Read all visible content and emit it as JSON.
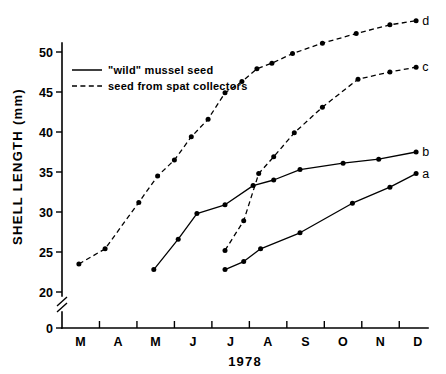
{
  "chart_data": {
    "type": "line",
    "title": "",
    "xlabel": "1978",
    "ylabel": "SHELL LENGTH (mm)",
    "x_tick_labels": [
      "M",
      "A",
      "M",
      "J",
      "J",
      "A",
      "S",
      "O",
      "N",
      "D"
    ],
    "x_tick_label_months": [
      "March",
      "April",
      "May",
      "June",
      "July",
      "August",
      "September",
      "October",
      "November",
      "December"
    ],
    "y_tick_labels": [
      "0",
      "20",
      "25",
      "30",
      "35",
      "40",
      "45",
      "50"
    ],
    "y_tick_values": [
      0,
      20,
      25,
      30,
      35,
      40,
      45,
      50
    ],
    "ylim": [
      20,
      55
    ],
    "xlim": [
      3,
      12.8
    ],
    "grid": false,
    "axis_break": true,
    "axis_break_note": "y-axis broken between 0 and 20",
    "legend_position": "upper-left-inside",
    "legend": [
      {
        "key": "solid",
        "label": "\"wild\" mussel seed",
        "style": "solid"
      },
      {
        "key": "dashed",
        "label": "seed from spat collectors",
        "style": "dashed"
      }
    ],
    "series": [
      {
        "name": "d",
        "label": "d",
        "style": "dashed",
        "description": "seed from spat collectors, earliest cohort",
        "x": [
          3.45,
          4.15,
          5.05,
          5.55,
          6.0,
          6.45,
          6.9,
          7.35,
          7.8,
          8.2,
          8.6,
          9.15,
          9.95,
          10.85,
          11.75,
          12.45
        ],
        "values": [
          23.5,
          25.4,
          31.2,
          34.5,
          36.5,
          39.4,
          41.6,
          44.9,
          46.3,
          47.9,
          48.6,
          49.8,
          51.1,
          52.3,
          53.4,
          53.9
        ]
      },
      {
        "name": "c",
        "label": "c",
        "style": "dashed",
        "description": "seed from spat collectors, late cohort",
        "x": [
          7.35,
          7.85,
          8.25,
          8.65,
          9.2,
          9.95,
          10.9,
          11.75,
          12.45
        ],
        "values": [
          25.2,
          28.9,
          34.8,
          36.9,
          39.9,
          43.1,
          46.6,
          47.5,
          48.1
        ]
      },
      {
        "name": "b",
        "label": "b",
        "style": "solid",
        "description": "\"wild\" mussel seed, early cohort",
        "x": [
          5.45,
          6.1,
          6.6,
          7.35,
          8.1,
          8.65,
          9.35,
          10.5,
          11.45,
          12.45
        ],
        "values": [
          22.8,
          26.6,
          29.8,
          30.9,
          33.3,
          34.0,
          35.3,
          36.1,
          36.6,
          37.5
        ]
      },
      {
        "name": "a",
        "label": "a",
        "style": "solid",
        "description": "\"wild\" mussel seed, late cohort",
        "x": [
          7.35,
          7.85,
          8.3,
          9.35,
          10.75,
          11.75,
          12.45
        ],
        "values": [
          22.8,
          23.8,
          25.4,
          27.4,
          31.1,
          33.1,
          34.8
        ]
      }
    ]
  }
}
